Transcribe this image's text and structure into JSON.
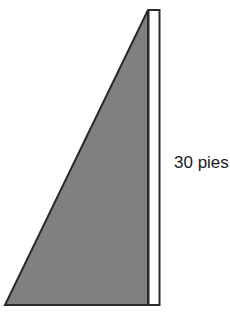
{
  "figure": {
    "background_color": "#ffffff",
    "width": 230,
    "height": 315,
    "shapes": {
      "triangle": {
        "name": "gray-right-triangle",
        "fill_color": "#808080",
        "stroke_color": "#2a2a2a",
        "stroke_width": 2,
        "points": "148,10 148,305 5,305"
      },
      "height_bar": {
        "name": "height-measure-bar",
        "fill_color": "#ffffff",
        "stroke_color": "#2a2a2a",
        "stroke_width": 2,
        "x": 148,
        "y": 10,
        "width": 11,
        "height": 295
      }
    },
    "labels": {
      "height": {
        "text": "30 pies",
        "value": "30",
        "unit": "pies",
        "color": "#1a1a1a",
        "font_size": "17"
      }
    }
  },
  "chart_data": {
    "type": "diagram",
    "shape": "right triangle",
    "annotations": [
      {
        "label": "30 pies",
        "measures": "vertical side (height)",
        "value": 30,
        "unit": "pies"
      }
    ],
    "fill_color": "#808080",
    "outline_color": "#2a2a2a"
  }
}
